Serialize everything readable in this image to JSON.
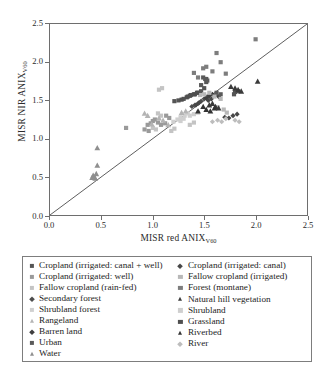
{
  "chart_data": {
    "type": "scatter",
    "title": "",
    "xlabel": "MISR red ANIX",
    "xlabel_sub": "V60",
    "ylabel": "MISR NIR ANIX",
    "ylabel_sub": "V60",
    "xlim": [
      0.0,
      2.5
    ],
    "ylim": [
      0.0,
      2.5
    ],
    "xticks": [
      "0.0",
      "0.5",
      "1.0",
      "1.5",
      "2.0",
      "2.5"
    ],
    "yticks": [
      "0.0",
      "0.5",
      "1.0",
      "1.5",
      "2.0",
      "2.5"
    ],
    "xtick_values": [
      0.0,
      0.5,
      1.0,
      1.5,
      2.0,
      2.5
    ],
    "ytick_values": [
      0.0,
      0.5,
      1.0,
      1.5,
      2.0,
      2.5
    ],
    "grid": false,
    "legend_position": "below-plot",
    "reference_line": {
      "label": "1:1 line",
      "from": [
        0.0,
        0.0
      ],
      "to": [
        2.5,
        2.5
      ],
      "color": "#4a4a4a"
    },
    "series": [
      {
        "name": "Cropland (irrigated: canal + well)",
        "marker": "square",
        "color": "#555555",
        "points": [
          [
            1.3,
            1.52
          ],
          [
            1.34,
            1.55
          ],
          [
            1.37,
            1.57
          ],
          [
            1.41,
            1.58
          ],
          [
            1.44,
            1.6
          ],
          [
            1.47,
            1.62
          ],
          [
            1.5,
            1.66
          ],
          [
            1.52,
            1.74
          ],
          [
            1.52,
            1.78
          ],
          [
            1.25,
            1.5
          ],
          [
            1.21,
            1.49
          ],
          [
            1.8,
            1.61
          ],
          [
            1.83,
            1.62
          ],
          [
            1.79,
            1.58
          ]
        ]
      },
      {
        "name": "Cropland (irrigated: well)",
        "marker": "square",
        "color": "#9a9a9a",
        "points": [
          [
            0.74,
            1.14
          ],
          [
            0.95,
            1.18
          ],
          [
            0.98,
            1.2
          ],
          [
            1.0,
            1.23
          ],
          [
            1.02,
            1.25
          ],
          [
            1.05,
            1.21
          ],
          [
            1.08,
            1.18
          ],
          [
            1.12,
            1.2
          ],
          [
            0.92,
            1.12
          ],
          [
            0.96,
            1.1
          ],
          [
            1.13,
            1.3
          ],
          [
            1.16,
            1.27
          ]
        ]
      },
      {
        "name": "Fallow cropland (rain-fed)",
        "marker": "square",
        "color": "#c4c4c4",
        "points": [
          [
            1.05,
            1.33
          ],
          [
            1.08,
            1.3
          ],
          [
            1.0,
            1.14
          ],
          [
            1.03,
            1.12
          ],
          [
            1.18,
            1.1
          ],
          [
            1.21,
            1.13
          ],
          [
            1.36,
            1.18
          ],
          [
            1.4,
            1.21
          ],
          [
            1.06,
            1.64
          ],
          [
            1.09,
            1.66
          ]
        ]
      },
      {
        "name": "Secondary forest",
        "marker": "diamond",
        "color": "#4d4d4d",
        "points": [
          [
            1.44,
            1.46
          ],
          [
            1.47,
            1.49
          ],
          [
            1.38,
            1.42
          ],
          [
            1.41,
            1.44
          ],
          [
            1.5,
            1.52
          ],
          [
            1.53,
            1.55
          ]
        ]
      },
      {
        "name": "Shrubland forest",
        "marker": "square",
        "color": "#d0d0d0",
        "points": [
          [
            1.27,
            1.28
          ],
          [
            1.31,
            1.3
          ],
          [
            1.2,
            1.22
          ],
          [
            1.24,
            1.25
          ],
          [
            1.34,
            1.33
          ]
        ]
      },
      {
        "name": "Rangeland",
        "marker": "triangle",
        "color": "#b4b4b4",
        "points": [
          [
            0.92,
            1.33
          ],
          [
            0.95,
            1.3
          ],
          [
            1.06,
            1.27
          ],
          [
            1.1,
            1.24
          ],
          [
            0.99,
            1.19
          ],
          [
            1.15,
            1.18
          ],
          [
            1.28,
            1.34
          ],
          [
            1.32,
            1.36
          ]
        ]
      },
      {
        "name": "Barren land",
        "marker": "diamond",
        "color": "#3f3f3f",
        "points": [
          [
            1.55,
            1.56
          ],
          [
            1.58,
            1.58
          ],
          [
            1.61,
            1.57
          ],
          [
            1.64,
            1.55
          ],
          [
            1.52,
            1.53
          ]
        ]
      },
      {
        "name": "Urban",
        "marker": "square",
        "color": "#5a5a5a",
        "points": [
          [
            1.49,
            1.8
          ],
          [
            1.51,
            1.78
          ],
          [
            1.53,
            1.76
          ],
          [
            1.47,
            1.7
          ],
          [
            1.62,
            1.6
          ],
          [
            1.66,
            1.58
          ]
        ]
      },
      {
        "name": "Water",
        "marker": "triangle",
        "color": "#8f8f8f",
        "points": [
          [
            0.42,
            0.52
          ],
          [
            0.43,
            0.5
          ],
          [
            0.44,
            0.48
          ],
          [
            0.45,
            0.54
          ],
          [
            0.46,
            0.88
          ],
          [
            0.46,
            0.65
          ],
          [
            0.41,
            0.49
          ]
        ]
      },
      {
        "name": "Cropland (irrigated: canal)",
        "marker": "diamond",
        "color": "#474747",
        "points": [
          [
            1.42,
            1.44
          ],
          [
            1.45,
            1.47
          ],
          [
            1.54,
            1.5
          ],
          [
            1.57,
            1.52
          ],
          [
            1.7,
            1.28
          ],
          [
            1.74,
            1.27
          ],
          [
            1.78,
            1.3
          ],
          [
            1.82,
            1.32
          ]
        ]
      },
      {
        "name": "Fallow cropland (irrigated)",
        "marker": "square",
        "color": "#b8b8b8",
        "points": [
          [
            1.46,
            1.57
          ],
          [
            1.5,
            1.58
          ],
          [
            1.55,
            1.6
          ],
          [
            1.6,
            1.55
          ],
          [
            1.66,
            1.52
          ],
          [
            1.63,
            1.41
          ],
          [
            1.69,
            1.38
          ],
          [
            1.72,
            1.34
          ]
        ]
      },
      {
        "name": "Forest (montane)",
        "marker": "square",
        "color": "#7d7d7d",
        "points": [
          [
            1.49,
            1.92
          ],
          [
            1.52,
            1.94
          ],
          [
            1.58,
            1.88
          ],
          [
            1.62,
            2.12
          ],
          [
            1.66,
            2.0
          ],
          [
            1.71,
            1.85
          ],
          [
            1.44,
            1.8
          ],
          [
            2.0,
            2.3
          ],
          [
            1.4,
            1.86
          ]
        ]
      },
      {
        "name": "Natural hill vegetation",
        "marker": "triangle",
        "color": "#3a3a3a",
        "points": [
          [
            1.58,
            1.46
          ],
          [
            1.61,
            1.42
          ],
          [
            1.64,
            1.4
          ],
          [
            1.55,
            1.44
          ],
          [
            1.8,
            1.66
          ],
          [
            1.83,
            1.64
          ],
          [
            1.86,
            1.62
          ],
          [
            1.76,
            1.68
          ],
          [
            2.02,
            1.75
          ]
        ]
      },
      {
        "name": "Shrubland",
        "marker": "square",
        "color": "#cfcfcf",
        "points": [
          [
            1.36,
            1.3
          ],
          [
            1.4,
            1.32
          ],
          [
            1.3,
            1.26
          ],
          [
            1.27,
            1.23
          ],
          [
            1.44,
            1.34
          ]
        ]
      },
      {
        "name": "Grassland",
        "marker": "square",
        "color": "#4f4f4f",
        "points": [
          [
            1.33,
            1.54
          ],
          [
            1.36,
            1.56
          ],
          [
            1.4,
            1.58
          ],
          [
            1.43,
            1.6
          ],
          [
            1.28,
            1.51
          ]
        ]
      },
      {
        "name": "Riverbed",
        "marker": "triangle",
        "color": "#333333",
        "points": [
          [
            1.52,
            1.38
          ],
          [
            1.56,
            1.36
          ],
          [
            1.6,
            1.4
          ],
          [
            1.49,
            1.42
          ],
          [
            1.44,
            1.36
          ]
        ]
      },
      {
        "name": "River",
        "marker": "diamond",
        "color": "#bdbdbd",
        "points": [
          [
            1.63,
            1.24
          ],
          [
            1.67,
            1.22
          ],
          [
            1.71,
            1.26
          ],
          [
            1.58,
            1.22
          ],
          [
            1.8,
            1.24
          ],
          [
            1.84,
            1.22
          ]
        ]
      }
    ]
  },
  "legend": {
    "columns": [
      {
        "items": [
          {
            "label": "Cropland (irrigated: canal + well)",
            "marker": "square",
            "color": "#555555"
          },
          {
            "label": "Cropland (irrigated: well)",
            "marker": "square",
            "color": "#9a9a9a"
          },
          {
            "label": "Fallow cropland (rain-fed)",
            "marker": "square",
            "color": "#c4c4c4"
          },
          {
            "label": "Secondary forest",
            "marker": "diamond",
            "color": "#4d4d4d"
          },
          {
            "label": "Shrubland forest",
            "marker": "square",
            "color": "#d0d0d0"
          },
          {
            "label": "Rangeland",
            "marker": "triangle",
            "color": "#b4b4b4"
          },
          {
            "label": "Barren land",
            "marker": "diamond",
            "color": "#3f3f3f"
          },
          {
            "label": "Urban",
            "marker": "square",
            "color": "#5a5a5a"
          },
          {
            "label": "Water",
            "marker": "triangle",
            "color": "#8f8f8f"
          }
        ]
      },
      {
        "items": [
          {
            "label": "Cropland (irrigated: canal)",
            "marker": "diamond",
            "color": "#474747"
          },
          {
            "label": "Fallow cropland (irrigated)",
            "marker": "square",
            "color": "#b8b8b8"
          },
          {
            "label": "Forest (montane)",
            "marker": "square",
            "color": "#7d7d7d"
          },
          {
            "label": "Natural hill vegetation",
            "marker": "triangle",
            "color": "#3a3a3a"
          },
          {
            "label": "Shrubland",
            "marker": "square",
            "color": "#cfcfcf"
          },
          {
            "label": "Grassland",
            "marker": "square",
            "color": "#4f4f4f"
          },
          {
            "label": "Riverbed",
            "marker": "triangle",
            "color": "#333333"
          },
          {
            "label": "River",
            "marker": "diamond",
            "color": "#bdbdbd"
          }
        ]
      }
    ]
  }
}
